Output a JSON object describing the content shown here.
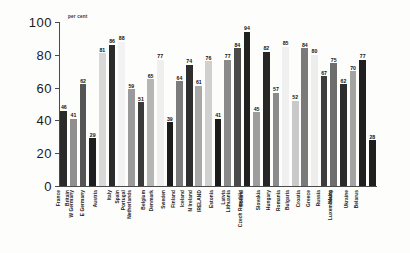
{
  "chart_data": {
    "type": "bar",
    "title": "",
    "subtitle": "",
    "xlabel": "",
    "ylabel": "per cent",
    "axis_note": "per cent",
    "ylim": [
      0,
      100
    ],
    "yticks": [
      0,
      20,
      40,
      60,
      80,
      100
    ],
    "grid": false,
    "legend": "none",
    "categories": [
      "France",
      "Britain",
      "W Germany",
      "E Germany",
      "Austria",
      "Italy",
      "Spain",
      "Portugal",
      "Netherlands",
      "Belgium",
      "Denmark",
      "Sweden",
      "Finland",
      "Iceland",
      "N Ireland",
      "IRELAND",
      "Estonia",
      "Latvia",
      "Lithuania",
      "Poland",
      "Czech Republic",
      "Slovakia",
      "Hungary",
      "Romania",
      "Bulgaria",
      "Croatia",
      "Greece",
      "Russia",
      "Malta",
      "Luxembourg",
      "Ukraine",
      "Belarus"
    ],
    "values": [
      46,
      41,
      62,
      29,
      81,
      86,
      88,
      59,
      51,
      65,
      77,
      39,
      64,
      74,
      61,
      76,
      41,
      77,
      84,
      94,
      45,
      82,
      57,
      85,
      52,
      84,
      80,
      67,
      75,
      62,
      70,
      77
    ],
    "bar_shades": [
      "#2a2a2a",
      "#8f8f8f",
      "#555555",
      "#1e1e1e",
      "#d8d8d8",
      "#2b2b2b",
      "#f2f2f2",
      "#9a9a9a",
      "#3a3a3a",
      "#b5b5b5",
      "#efefef",
      "#1c1c1c",
      "#7b7b7b",
      "#2e2e2e",
      "#a8a8a8",
      "#d0d0d0",
      "#1a1a1a",
      "#8a8a8a",
      "#4a4a4a",
      "#202020",
      "#9d9d9d",
      "#262626",
      "#8b8b8b",
      "#f0f0f0",
      "#c9c9c9",
      "#7a7a7a",
      "#ededed",
      "#3d3d3d",
      "#6e6e6e",
      "#2c2c2c",
      "#a3a3a3",
      "#1f1f1f"
    ],
    "extra_bar": {
      "label": "",
      "value": 28,
      "shade": "#1f1f1f"
    }
  },
  "colors": {
    "axis": "#4a4a4a",
    "text": "#1a1a1a",
    "background": "#fdfdfc"
  }
}
